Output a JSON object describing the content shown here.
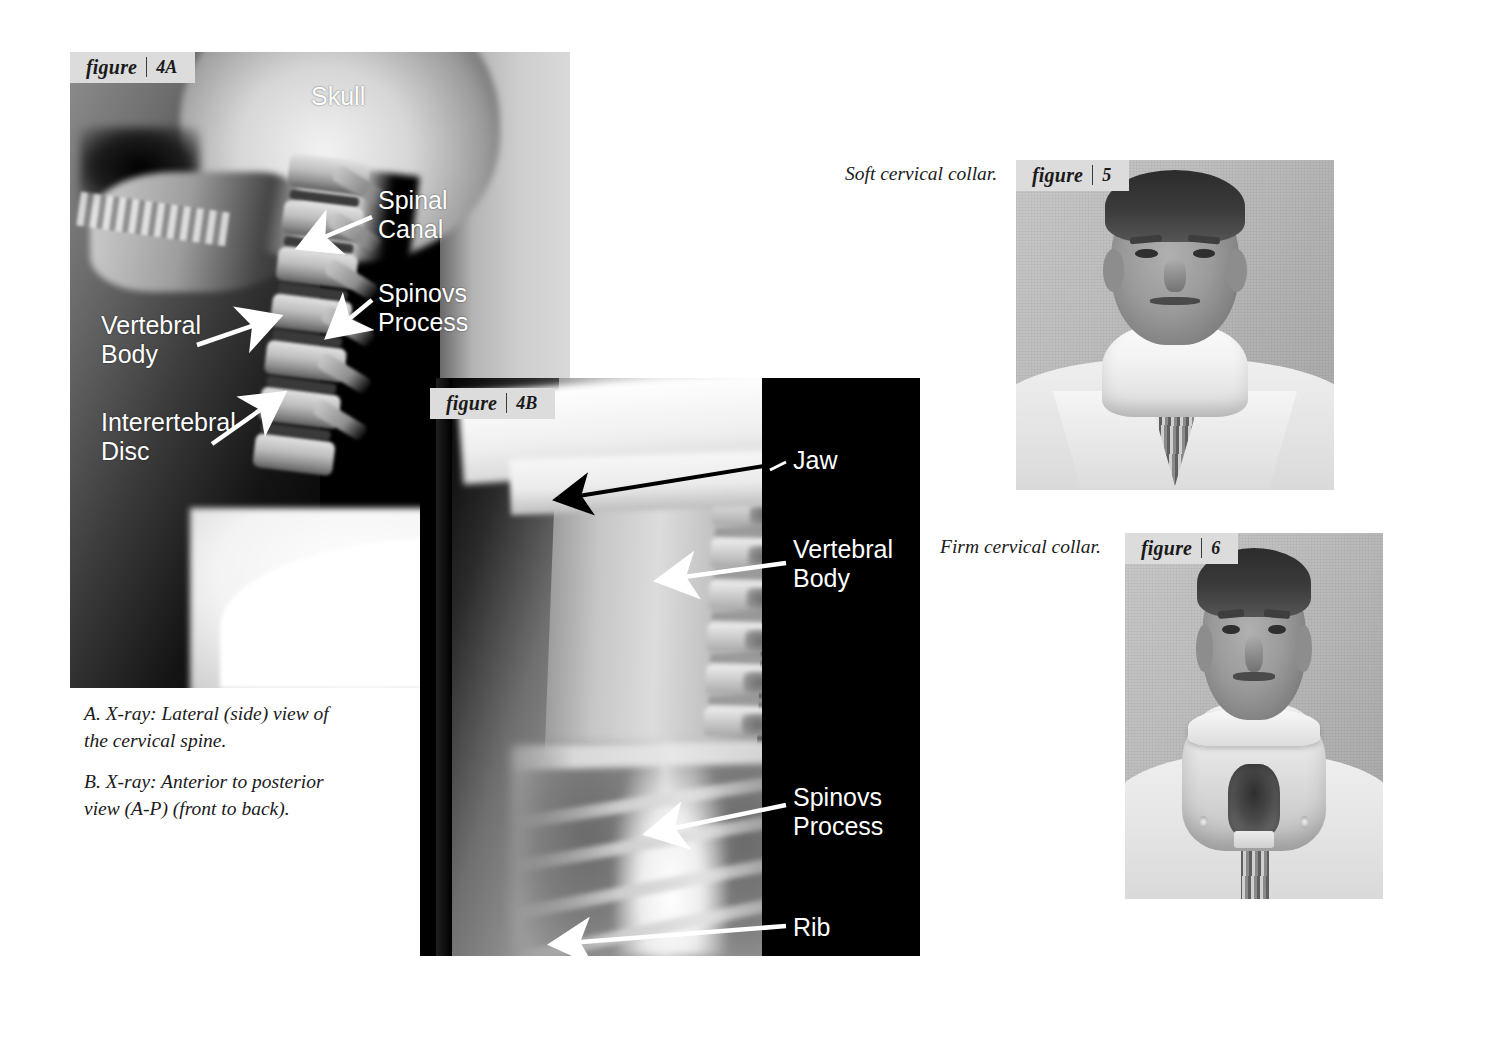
{
  "page": {
    "background_color": "#ffffff",
    "badge_color": "#dcdcdc",
    "label_text_color": "#ffffff",
    "caption_text_color": "#1b1b1b"
  },
  "figures": [
    {
      "id": "4A",
      "badge_word": "figure",
      "badge_number": "4A",
      "type": "x-ray",
      "labels": [
        {
          "name": "skull",
          "text": "Skull",
          "arrow": false
        },
        {
          "name": "spinal-canal",
          "text": "Spinal\nCanal",
          "arrow": true,
          "arrow_color": "#ffffff"
        },
        {
          "name": "vertebral-body",
          "text": "Vertebral\nBody",
          "arrow": true,
          "arrow_color": "#ffffff"
        },
        {
          "name": "spinovs-process",
          "text": "Spinovs\nProcess",
          "arrow": true,
          "arrow_color": "#ffffff"
        },
        {
          "name": "interertebral-disc",
          "text": "Interertebral\nDisc",
          "arrow": true,
          "arrow_color": "#ffffff"
        }
      ]
    },
    {
      "id": "4B",
      "badge_word": "figure",
      "badge_number": "4B",
      "type": "x-ray",
      "labels": [
        {
          "name": "jaw",
          "text": "Jaw",
          "arrow": true,
          "arrow_color": "#000000"
        },
        {
          "name": "vertebral-body",
          "text": "Vertebral\nBody",
          "arrow": true,
          "arrow_color": "#ffffff"
        },
        {
          "name": "spinovs-process",
          "text": "Spinovs\nProcess",
          "arrow": true,
          "arrow_color": "#ffffff"
        },
        {
          "name": "rib",
          "text": "Rib",
          "arrow": true,
          "arrow_color": "#ffffff"
        }
      ]
    },
    {
      "id": "5",
      "badge_word": "figure",
      "badge_number": "5",
      "type": "photograph",
      "caption": "Soft cervical collar."
    },
    {
      "id": "6",
      "badge_word": "figure",
      "badge_number": "6",
      "type": "photograph",
      "caption": "Firm cervical collar."
    }
  ],
  "captions": {
    "a_line1": "A. X-ray: Lateral (side) view of",
    "a_line2": "the cervical spine.",
    "b_line1": "B. X-ray: Anterior to posterior",
    "b_line2": "view (A-P) (front to back).",
    "fig5": "Soft cervical collar.",
    "fig6": "Firm cervical collar."
  },
  "xray_labels": {
    "f4a_skull": "Skull",
    "f4a_spinal_canal_l1": "Spinal",
    "f4a_spinal_canal_l2": "Canal",
    "f4a_spinovs_l1": "Spinovs",
    "f4a_spinovs_l2": "Process",
    "f4a_vertebral_l1": "Vertebral",
    "f4a_vertebral_l2": "Body",
    "f4a_disc_l1": "Interertebral",
    "f4a_disc_l2": "Disc",
    "f4b_jaw": "Jaw",
    "f4b_vertebral_l1": "Vertebral",
    "f4b_vertebral_l2": "Body",
    "f4b_spinovs_l1": "Spinovs",
    "f4b_spinovs_l2": "Process",
    "f4b_rib": "Rib"
  },
  "badges": {
    "word": "figure",
    "n4a": "4A",
    "n4b": "4B",
    "n5": "5",
    "n6": "6"
  }
}
